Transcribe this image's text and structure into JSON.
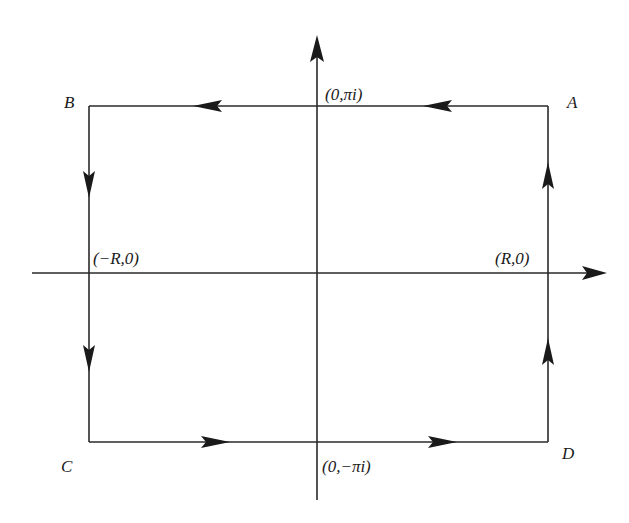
{
  "diagram": {
    "type": "contour-integration-rectangle",
    "colors": {
      "line": "#2a2a2a",
      "arrow": "#1a1a1a",
      "text": "#1a1a1a",
      "background": "#ffffff"
    },
    "labels": {
      "corner_A": "A",
      "corner_B": "B",
      "corner_C": "C",
      "corner_D": "D",
      "top_mid": "(0,πi)",
      "bottom_mid": "(0,−πi)",
      "left_mid": "(−R,0)",
      "right_mid": "(R,0)"
    },
    "edges": [
      {
        "from": "A",
        "to": "B",
        "direction": "left",
        "arrows": 2
      },
      {
        "from": "B",
        "to": "C",
        "direction": "down",
        "arrows": 2
      },
      {
        "from": "C",
        "to": "D",
        "direction": "right",
        "arrows": 2
      },
      {
        "from": "D",
        "to": "A",
        "direction": "up",
        "arrows": 2
      }
    ],
    "axes": {
      "x_axis_arrow": "right",
      "y_axis_arrow": "up"
    }
  }
}
